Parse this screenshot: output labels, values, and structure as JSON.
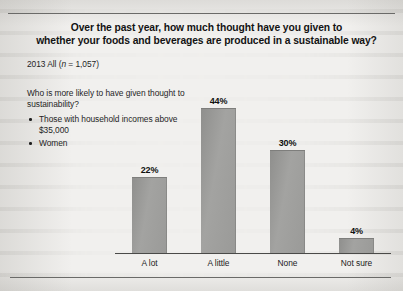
{
  "title": {
    "line1": "Over the past year, how much thought have you given to",
    "line2": "whether your foods and beverages are produced in a sustainable way?"
  },
  "subtitle": {
    "prefix": "2013 All (",
    "italic": "n",
    "suffix": " = 1,057)"
  },
  "callout": {
    "lead": "Who is more likely to have given thought to sustainability?",
    "bullets": [
      "Those with household incomes above $35,000",
      "Women"
    ]
  },
  "chart_data": {
    "type": "bar",
    "title": "Over the past year, how much thought have you given to whether your foods and beverages are produced in a sustainable way?",
    "subtitle": "2013 All (n = 1,057)",
    "categories": [
      "A lot",
      "A little",
      "None",
      "Not sure"
    ],
    "values": [
      22,
      44,
      30,
      4
    ],
    "value_labels": [
      "22%",
      "44%",
      "30%",
      "4%"
    ],
    "xlabel": "",
    "ylabel": "",
    "ylim": [
      0,
      50
    ],
    "grid": false,
    "legend": "none",
    "units": "percent",
    "bar_color": "#9a9a98",
    "axis_color": "#4a4a48"
  }
}
